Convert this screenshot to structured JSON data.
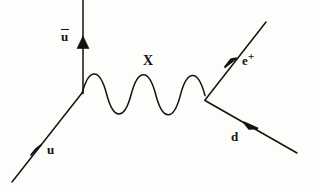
{
  "figure": {
    "kind": "feynman-diagram",
    "title": "",
    "background_color": "#fdfdfb",
    "line_color": "#15110f",
    "line_width": 1.4,
    "width": 313,
    "height": 190
  },
  "labels": {
    "antiup": {
      "text": "u",
      "overline": true,
      "display": "ū",
      "x": 61,
      "y": 29
    },
    "boson": {
      "text": "X",
      "x": 143,
      "y": 54
    },
    "positron": {
      "base": "e",
      "superscript": "+",
      "text": "e+",
      "x": 242,
      "y": 54
    },
    "down": {
      "text": "d",
      "x": 231,
      "y": 130
    },
    "up": {
      "text": "u",
      "x": 47,
      "y": 143
    }
  },
  "vertices": {
    "left": {
      "x": 82,
      "y": 93
    },
    "right": {
      "x": 205,
      "y": 100
    }
  },
  "lines": [
    {
      "name": "up-quark-incoming",
      "particle": "u",
      "style": "straight",
      "from": {
        "x": 12,
        "y": 182
      },
      "to": {
        "x": 82,
        "y": 93
      },
      "arrow": {
        "at": {
          "x": 40,
          "y": 147
        },
        "direction": "toward-vertex"
      }
    },
    {
      "name": "antiup-quark-outgoing",
      "particle": "ubar",
      "style": "straight",
      "from": {
        "x": 83,
        "y": 93
      },
      "to": {
        "x": 83,
        "y": 0
      },
      "arrow": {
        "at": {
          "x": 83,
          "y": 44
        },
        "direction": "up"
      }
    },
    {
      "name": "x-boson-propagator",
      "particle": "X",
      "style": "wavy",
      "from": {
        "x": 82,
        "y": 93
      },
      "to": {
        "x": 205,
        "y": 100
      },
      "cycles": 5,
      "amplitude": 22,
      "arrow": null
    },
    {
      "name": "positron-outgoing",
      "particle": "e+",
      "style": "straight",
      "from": {
        "x": 205,
        "y": 100
      },
      "to": {
        "x": 266,
        "y": 22
      },
      "arrow": {
        "at": {
          "x": 233,
          "y": 60
        },
        "direction": "away-from-vertex"
      }
    },
    {
      "name": "down-quark-incoming",
      "particle": "d",
      "style": "straight",
      "from": {
        "x": 205,
        "y": 100
      },
      "to": {
        "x": 297,
        "y": 153
      },
      "arrow": {
        "at": {
          "x": 250,
          "y": 126
        },
        "direction": "toward-vertex"
      }
    }
  ]
}
